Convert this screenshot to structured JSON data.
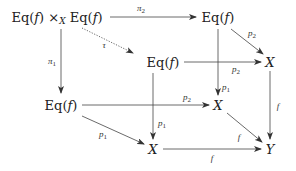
{
  "diagram": {
    "type": "commutative-diagram",
    "nodes": {
      "pullback": {
        "label": "Eq(f) ×_X Eq(f)",
        "left": "Eq(",
        "f": "f",
        "right": ")",
        "times": "×",
        "sub": "X",
        "left2": "Eq(",
        "right2": ")"
      },
      "eq_top": {
        "pre": "Eq(",
        "f": "f",
        "post": ")"
      },
      "eq_mid": {
        "pre": "Eq(",
        "f": "f",
        "post": ")"
      },
      "x_right": {
        "label": "X"
      },
      "eq_left": {
        "pre": "Eq(",
        "f": "f",
        "post": ")"
      },
      "x_mid": {
        "label": "X"
      },
      "x_bottom": {
        "label": "X"
      },
      "y_bottom": {
        "label": "Y"
      }
    },
    "arrows": [
      {
        "from": "pullback",
        "to": "eq_top",
        "label": "π",
        "sub": "2",
        "style": "solid"
      },
      {
        "from": "pullback",
        "to": "eq_left",
        "label": "π",
        "sub": "1",
        "style": "solid"
      },
      {
        "from": "pullback",
        "to": "eq_mid",
        "label": "τ",
        "style": "dotted"
      },
      {
        "from": "eq_top",
        "to": "x_right",
        "label": "p",
        "sub": "2",
        "style": "solid"
      },
      {
        "from": "eq_top",
        "to": "x_mid",
        "label": "p",
        "sub": "1",
        "style": "solid"
      },
      {
        "from": "eq_mid",
        "to": "x_right",
        "label": "p",
        "sub": "2",
        "style": "solid"
      },
      {
        "from": "eq_mid",
        "to": "x_bottom",
        "label": "p",
        "sub": "1",
        "style": "solid"
      },
      {
        "from": "eq_left",
        "to": "x_mid",
        "label": "p",
        "sub": "2",
        "style": "solid"
      },
      {
        "from": "eq_left",
        "to": "x_bottom",
        "label": "p",
        "sub": "1",
        "style": "solid"
      },
      {
        "from": "x_right",
        "to": "y_bottom",
        "label": "f",
        "style": "solid"
      },
      {
        "from": "x_mid",
        "to": "y_bottom",
        "label": "f",
        "style": "solid"
      },
      {
        "from": "x_bottom",
        "to": "y_bottom",
        "label": "f",
        "style": "solid"
      }
    ],
    "labels": {
      "pi": "π",
      "tau": "τ",
      "p": "p",
      "f": "f",
      "one": "1",
      "two": "2"
    }
  }
}
